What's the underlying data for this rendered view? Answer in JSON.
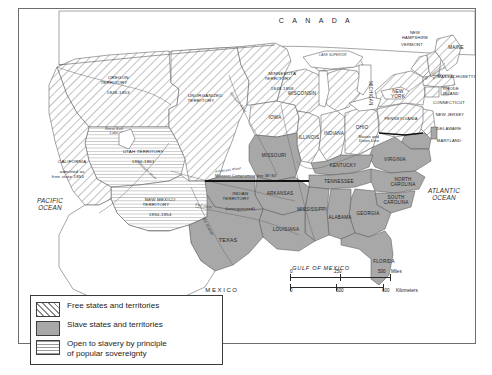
{
  "map": {
    "title": "United States 1850: Free and Slave States and Territories",
    "countries": {
      "canada": "C A N A D A",
      "mexico": "MEXICO"
    },
    "oceans": {
      "pacific": "PACIFIC\nOCEAN",
      "atlantic": "ATLANTIC\nOCEAN",
      "gulf": "GULF OF MEXICO"
    },
    "territories": [
      {
        "name": "OREGON\nTERRITORY",
        "dates": "1848-1853",
        "status": "free"
      },
      {
        "name": "UNORGANIZED\nTERRITORY",
        "dates": "",
        "status": "free"
      },
      {
        "name": "MINNESOTA\nTERRITORY",
        "dates": "1849-1858",
        "status": "free"
      },
      {
        "name": "UTAH TERRITORY",
        "dates": "1850-1861",
        "status": "popular-sovereignty"
      },
      {
        "name": "NEW MEXICO\nTERRITORY",
        "dates": "1850-1854",
        "status": "popular-sovereignty"
      },
      {
        "name": "INDIAN\nTERRITORY",
        "dates": "(unorganized)",
        "status": "slave"
      }
    ],
    "california": {
      "name": "CALIFORNIA",
      "note": "admitted as\nfree state 1850"
    },
    "states": [
      {
        "label": "IOWA"
      },
      {
        "label": "WISCONSIN"
      },
      {
        "label": "ILLINOIS"
      },
      {
        "label": "INDIANA"
      },
      {
        "label": "OHIO"
      },
      {
        "label": "MICHIGAN"
      },
      {
        "label": "MISSOURI"
      },
      {
        "label": "KENTUCKY"
      },
      {
        "label": "VIRGINIA"
      },
      {
        "label": "TENNESSEE"
      },
      {
        "label": "NORTH\nCAROLINA"
      },
      {
        "label": "SOUTH\nCAROLINA"
      },
      {
        "label": "GEORGIA"
      },
      {
        "label": "ALABAMA"
      },
      {
        "label": "MISSISSIPPI"
      },
      {
        "label": "ARKANSAS"
      },
      {
        "label": "LOUISIANA"
      },
      {
        "label": "TEXAS"
      },
      {
        "label": "FLORIDA"
      },
      {
        "label": "PENNSYLVANIA"
      },
      {
        "label": "NEW\nYORK"
      },
      {
        "label": "MAINE"
      },
      {
        "label": "NEW\nHAMPSHIRE"
      },
      {
        "label": "VERMONT"
      },
      {
        "label": "MASSACHUSETTS"
      },
      {
        "label": "RHODE\nISLAND"
      },
      {
        "label": "CONNECTICUT"
      },
      {
        "label": "NEW JERSEY"
      },
      {
        "label": "DELAWARE"
      },
      {
        "label": "MARYLAND"
      }
    ],
    "annotations": [
      {
        "text": "Missouri Compromise line 36°30'"
      },
      {
        "text": "Mason and\nDixon Line"
      },
      {
        "text": "Great Salt\nLake"
      },
      {
        "text": "LAKE SUPERIOR"
      },
      {
        "text": "St. Lawrence\nRiver"
      },
      {
        "text": "Missouri River"
      },
      {
        "text": "Arkansas River"
      },
      {
        "text": "Colorado River"
      },
      {
        "text": "Red River"
      },
      {
        "text": "Rio Grande"
      }
    ]
  },
  "legend": {
    "items": [
      {
        "pattern": "diagonal-hatch",
        "label": "Free states and territories"
      },
      {
        "pattern": "solid-gray",
        "label": "Slave states and territories"
      },
      {
        "pattern": "horizontal-lines",
        "label": "Open to slavery by principle\nof popular sovereignty"
      }
    ]
  },
  "scale": {
    "miles": {
      "ticks": [
        "0",
        "250",
        "500"
      ],
      "unit": "Miles"
    },
    "kilometers": {
      "ticks": [
        "0",
        "300",
        "600"
      ],
      "unit": "Kilometers"
    }
  },
  "colors": {
    "slave_fill": "#a8a8a8",
    "hatch_stroke": "#8d8d8d",
    "border": "#6d6d6d",
    "water": "#ffffff",
    "text": "#232323"
  }
}
